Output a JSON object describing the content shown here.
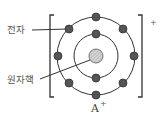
{
  "diagram": {
    "type": "atomic-structure",
    "labels": {
      "electron": "전자",
      "nucleus": "원자핵",
      "ion_symbol": "A",
      "ion_charge": "+",
      "bracket_charge": "+"
    },
    "shells": [
      {
        "name": "inner",
        "electron_count": 2
      },
      {
        "name": "outer",
        "electron_count": 8
      }
    ],
    "colors": {
      "electron_fill": "#555555",
      "nucleus_fill": "#c8c8c8",
      "line": "#333333"
    }
  }
}
